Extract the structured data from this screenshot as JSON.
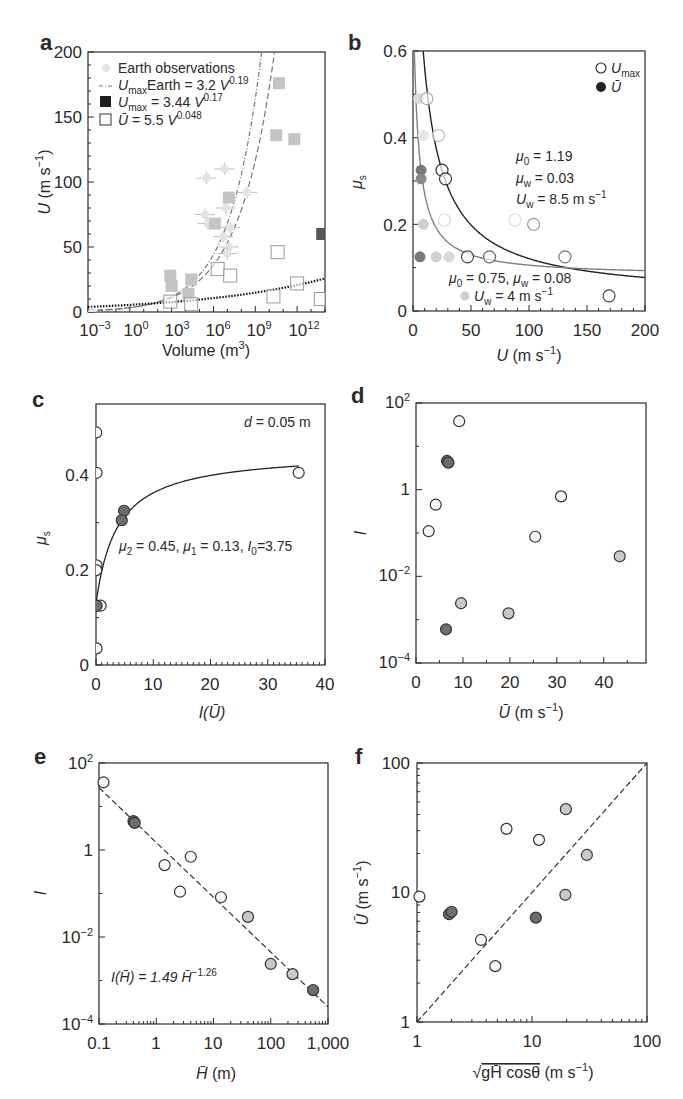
{
  "chart_data": [
    {
      "panel": "a",
      "type": "scatter",
      "xscale": "log",
      "xlabel": "Volume (m3)",
      "ylabel": "U (m s-1)",
      "xlim_log10": [
        -3,
        14
      ],
      "ylim": [
        0,
        200
      ],
      "xticks": [
        "10^-3",
        "10^0",
        "10^3",
        "10^6",
        "10^9",
        "10^12"
      ],
      "xtick_exp": [
        -3,
        0,
        3,
        6,
        9,
        12
      ],
      "yticks": [
        0,
        50,
        100,
        150,
        200
      ],
      "legend": [
        {
          "label": "Earth observations",
          "marker": "circle-light"
        },
        {
          "label": "UmaxEarth = 3.2 V^0.19",
          "marker": "dash-dot"
        },
        {
          "label": "Umax = 3.44 V^0.17",
          "marker": "square-filled"
        },
        {
          "label": "Ū = 5.5 V^0.048",
          "marker": "square-open"
        }
      ],
      "series": [
        {
          "name": "Earth observations",
          "points": [
            [
              -2.7,
              0
            ],
            [
              5.5,
              103
            ],
            [
              5.4,
              75
            ],
            [
              5.6,
              68
            ],
            [
              6.8,
              110
            ],
            [
              6.9,
              80
            ],
            [
              7.1,
              50
            ],
            [
              7.0,
              45
            ],
            [
              8.4,
              92
            ],
            [
              6.7,
              58
            ],
            [
              7.2,
              65
            ]
          ]
        },
        {
          "name": "Umax (filled squares)",
          "points": [
            [
              2.9,
              28
            ],
            [
              3.0,
              20
            ],
            [
              4.4,
              25
            ],
            [
              4.2,
              14
            ],
            [
              6.1,
              68
            ],
            [
              7.1,
              88
            ],
            [
              10.7,
              176
            ],
            [
              10.5,
              136
            ],
            [
              11.8,
              133
            ],
            [
              13.8,
              60
            ]
          ]
        },
        {
          "name": "Ū (open squares)",
          "points": [
            [
              2.9,
              8
            ],
            [
              4.4,
              6
            ],
            [
              6.3,
              33
            ],
            [
              7.2,
              28
            ],
            [
              10.6,
              46
            ],
            [
              10.3,
              12
            ],
            [
              12.0,
              22
            ],
            [
              13.7,
              10
            ]
          ]
        }
      ],
      "fits": [
        {
          "name": "UmaxEarth = 3.2 V^0.19",
          "a": 3.2,
          "b": 0.19,
          "style": "dash-dot"
        },
        {
          "name": "Umax = 3.44 V^0.17",
          "a": 3.44,
          "b": 0.17,
          "style": "dashed"
        },
        {
          "name": "Ū = 5.5 V^0.048",
          "a": 5.5,
          "b": 0.048,
          "style": "dotted"
        }
      ]
    },
    {
      "panel": "b",
      "type": "scatter",
      "xlabel": "U (m s-1)",
      "ylabel": "μs",
      "xlim": [
        0,
        200
      ],
      "ylim": [
        0,
        0.6
      ],
      "xticks": [
        0,
        50,
        100,
        150,
        200
      ],
      "yticks": [
        0,
        0.2,
        0.4,
        0.6
      ],
      "legend": [
        {
          "label": "Umax",
          "marker": "circle-open"
        },
        {
          "label": "Ū",
          "marker": "circle-filled"
        }
      ],
      "annotations": [
        {
          "text": "μ0 = 1.19",
          "x": 92,
          "y": 0.355
        },
        {
          "text": "μw = 0.03",
          "x": 92,
          "y": 0.305
        },
        {
          "text": "Uw = 8.5 m s-1",
          "x": 92,
          "y": 0.255
        },
        {
          "text": "μ0 = 0.75, μw = 0.08",
          "x": 30,
          "y": 0.075
        },
        {
          "text": "Uw = 4 m s-1",
          "x": 50,
          "y": 0.033
        }
      ],
      "series": [
        {
          "name": "Umax",
          "points": [
            [
              12,
              0.49
            ],
            [
              22,
              0.405
            ],
            [
              25,
              0.325
            ],
            [
              28,
              0.305
            ],
            [
              47,
              0.125
            ],
            [
              66,
              0.125
            ],
            [
              104,
              0.2
            ],
            [
              131,
              0.125
            ],
            [
              169,
              0.035
            ],
            [
              27,
              0.21
            ],
            [
              88,
              0.21
            ]
          ]
        },
        {
          "name": "Ū",
          "points": [
            [
              5,
              0.49
            ],
            [
              9,
              0.405
            ],
            [
              7,
              0.325
            ],
            [
              7,
              0.305
            ],
            [
              9,
              0.2
            ],
            [
              6,
              0.125
            ],
            [
              20,
              0.125
            ],
            [
              31,
              0.125
            ]
          ]
        }
      ],
      "fits": [
        {
          "name": "Umax fit",
          "mu0": 1.19,
          "muw": 0.03,
          "Uw": 8.5,
          "color": "#222222"
        },
        {
          "name": "Ū fit",
          "mu0": 0.75,
          "muw": 0.08,
          "Uw": 4,
          "color": "#808080"
        }
      ]
    },
    {
      "panel": "c",
      "type": "scatter",
      "xlabel": "I(Ū)",
      "ylabel": "μs",
      "xlim": [
        0,
        40
      ],
      "ylim": [
        0,
        0.55
      ],
      "xticks": [
        0,
        10,
        20,
        30,
        40
      ],
      "yticks": [
        0,
        0.2,
        0.4
      ],
      "annotations": [
        {
          "text": "d = 0.05 m"
        },
        {
          "text": "μ2 = 0.45, μ1 = 0.13, I0=3.75"
        }
      ],
      "fit": {
        "mu1": 0.13,
        "mu2": 0.45,
        "I0": 3.75
      },
      "series": [
        {
          "name": "open",
          "points": [
            [
              0.05,
              0.49
            ],
            [
              0.1,
              0.405
            ],
            [
              0.1,
              0.21
            ],
            [
              0.05,
              0.2
            ],
            [
              0.1,
              0.125
            ],
            [
              0.8,
              0.125
            ],
            [
              0.1,
              0.035
            ],
            [
              35.4,
              0.405
            ]
          ]
        },
        {
          "name": "dark",
          "points": [
            [
              4.9,
              0.325
            ],
            [
              4.5,
              0.305
            ],
            [
              0.1,
              0.125
            ]
          ]
        }
      ]
    },
    {
      "panel": "d",
      "type": "scatter",
      "xlabel": "Ū (m s-1)",
      "ylabel": "I",
      "yscale": "log",
      "xlim": [
        0,
        49
      ],
      "ylim_log10": [
        -4,
        2
      ],
      "xticks": [
        0,
        10,
        20,
        30,
        40
      ],
      "yticks": [
        "10^-4",
        "10^-2",
        "1",
        "10^2"
      ],
      "series": [
        {
          "name": "open",
          "points": [
            [
              9.2,
              38
            ],
            [
              4.2,
              0.45
            ],
            [
              2.7,
              0.11
            ],
            [
              25.4,
              0.082
            ],
            [
              30.9,
              0.7
            ]
          ]
        },
        {
          "name": "light-grey",
          "points": [
            [
              9.6,
              0.0024
            ],
            [
              19.7,
              0.0014
            ],
            [
              43.4,
              0.029
            ]
          ]
        },
        {
          "name": "dark",
          "points": [
            [
              6.6,
              4.6
            ],
            [
              6.9,
              4.2
            ],
            [
              6.4,
              0.0006
            ]
          ]
        }
      ]
    },
    {
      "panel": "e",
      "type": "scatter",
      "xlabel": "H̄ (m)",
      "ylabel": "I",
      "xscale": "log",
      "yscale": "log",
      "xlim_log10": [
        -1,
        3
      ],
      "ylim_log10": [
        -4,
        2
      ],
      "xticks": [
        "0.1",
        "1",
        "10",
        "100",
        "1,000"
      ],
      "yticks": [
        "10^-4",
        "10^-2",
        "1",
        "10^2"
      ],
      "annotation": "I(H̄) = 1.49 H̄^-1.26",
      "fit": {
        "a": 1.49,
        "b": -1.26,
        "style": "dashed"
      },
      "series": [
        {
          "name": "open",
          "points": [
            [
              0.12,
              36
            ],
            [
              1.4,
              0.45
            ],
            [
              2.6,
              0.11
            ],
            [
              13.5,
              0.082
            ],
            [
              4.0,
              0.7
            ]
          ]
        },
        {
          "name": "light-grey",
          "points": [
            [
              40,
              0.029
            ],
            [
              100,
              0.0024
            ],
            [
              240,
              0.0014
            ]
          ]
        },
        {
          "name": "dark",
          "points": [
            [
              0.4,
              4.6
            ],
            [
              0.42,
              4.2
            ],
            [
              550,
              0.0006
            ]
          ]
        }
      ]
    },
    {
      "panel": "f",
      "type": "scatter",
      "xlabel": "√(g H̄ cosθ) (m s-1)",
      "ylabel": "Ū (m s-1)",
      "xscale": "log",
      "yscale": "log",
      "xlim": [
        1,
        100
      ],
      "ylim": [
        1,
        100
      ],
      "xticks": [
        "1",
        "10",
        "100"
      ],
      "yticks": [
        "1",
        "10",
        "100"
      ],
      "reference_line": "1:1 dashed",
      "series": [
        {
          "name": "open",
          "points": [
            [
              1.05,
              9.3
            ],
            [
              3.6,
              4.3
            ],
            [
              4.8,
              2.7
            ],
            [
              6.0,
              31
            ],
            [
              11.5,
              25.5
            ]
          ]
        },
        {
          "name": "light-grey",
          "points": [
            [
              19.7,
              44
            ],
            [
              30,
              19.5
            ],
            [
              19.5,
              9.6
            ]
          ]
        },
        {
          "name": "dark",
          "points": [
            [
              1.9,
              6.8
            ],
            [
              2.0,
              7.1
            ],
            [
              10.8,
              6.4
            ]
          ]
        }
      ]
    }
  ],
  "labels": {
    "a": {
      "panel": "a",
      "legend_earth": "Earth observations",
      "legend_fit1_sym": "U",
      "legend_fit1_sub": "max",
      "legend_fit1_rest": "Earth = 3.2 ",
      "legend_fit1_v": "V",
      "legend_fit1_exp": "0.19",
      "legend_fit2_sym": "U",
      "legend_fit2_sub": "max",
      "legend_fit2_rest": " = 3.44 ",
      "legend_fit2_v": "V",
      "legend_fit2_exp": "0.17",
      "legend_fit3_sym": "Ū",
      "legend_fit3_rest": " = 5.5 ",
      "legend_fit3_v": "V",
      "legend_fit3_exp": "0.048",
      "xlabel": "Volume (m",
      "xlabel_sup": "3",
      "xlabel_end": ")",
      "ylabel_u": "U",
      "ylabel_rest": " (m s",
      "ylabel_sup": "−1",
      "ylabel_end": ")",
      "yticks": [
        "0",
        "50",
        "100",
        "150",
        "200"
      ],
      "xticks_base": "10",
      "xticks_exp": [
        "−3",
        "0",
        "3",
        "6",
        "9",
        "12"
      ]
    },
    "b": {
      "panel": "b",
      "yticks": [
        "0",
        "0.2",
        "0.4",
        "0.6"
      ],
      "xticks": [
        "0",
        "50",
        "100",
        "150",
        "200"
      ],
      "ylabel": "μ",
      "ylabel_sub": "s",
      "xlabel_u": "U",
      "xlabel_rest": " (m s",
      "xlabel_sup": "−1",
      "xlabel_end": ")",
      "legend_umax": "U",
      "legend_umax_sub": "max",
      "legend_ubar": "Ū",
      "ann1_mu": "μ",
      "ann1_sub": "0",
      "ann1_rest": " = 1.19",
      "ann2_mu": "μ",
      "ann2_sub": "w",
      "ann2_rest": " = 0.03",
      "ann3_u": "U",
      "ann3_sub": "w",
      "ann3_rest": " = 8.5 m s",
      "ann3_sup": "−1",
      "ann4_mu": "μ",
      "ann4_sub": "0",
      "ann4_mid": " = 0.75, ",
      "ann4_mu2": "μ",
      "ann4_sub2": "w",
      "ann4_rest": " = 0.08",
      "ann5_u": "U",
      "ann5_sub": "w",
      "ann5_rest": " = 4 m s",
      "ann5_sup": "−1"
    },
    "c": {
      "panel": "c",
      "yticks": [
        "0",
        "0.2",
        "0.4"
      ],
      "xticks": [
        "0",
        "10",
        "20",
        "30",
        "40"
      ],
      "ylabel": "μ",
      "ylabel_sub": "s",
      "xlabel": "I(Ū)",
      "ann_d": "d",
      "ann_d_rest": " = 0.05 m",
      "ann_mu2": "μ",
      "ann_mu2_sub": "2",
      "ann_mu2_rest": " = 0.45, ",
      "ann_mu1": "μ",
      "ann_mu1_sub": "1",
      "ann_mu1_rest": " = 0.13, ",
      "ann_i0": "I",
      "ann_i0_sub": "0",
      "ann_i0_rest": "=3.75"
    },
    "d": {
      "panel": "d",
      "xticks": [
        "0",
        "10",
        "20",
        "30",
        "40"
      ],
      "ytick_1": "1",
      "ytick_base": "10",
      "ytick_exp": [
        "−4",
        "−2",
        "2"
      ],
      "ylabel": "I",
      "xlabel_u": "Ū",
      "xlabel_rest": " (m s",
      "xlabel_sup": "−1",
      "xlabel_end": ")"
    },
    "e": {
      "panel": "e",
      "xticks": [
        "0.1",
        "1",
        "10",
        "100",
        "1,000"
      ],
      "ytick_1": "1",
      "ytick_base": "10",
      "ytick_exp": [
        "−4",
        "−2",
        "2"
      ],
      "ylabel": "I",
      "xlabel_h": "H̄",
      "xlabel_rest": " (m)",
      "ann_lhs": "I(H̄) = 1.49 ",
      "ann_h": "H̄",
      "ann_exp": "−1.26"
    },
    "f": {
      "panel": "f",
      "xticks": [
        "1",
        "10",
        "100"
      ],
      "yticks": [
        "1",
        "10",
        "100"
      ],
      "ylabel_u": "Ū",
      "ylabel_rest": " (m s",
      "ylabel_sup": "−1",
      "ylabel_end": ")",
      "xlabel_root": "√",
      "xlabel_inner": "gH̄ cosθ",
      "xlabel_rest": " (m s",
      "xlabel_sup": "−1",
      "xlabel_end": ")"
    }
  },
  "colors": {
    "frame": "#2a2a2a",
    "open_fill": "#f7f7f7",
    "light_grey_fill": "#c9c9c9",
    "dark_fill": "#6e6e6e",
    "earth_fill": "#e2e2e2",
    "square_fill": "#c4c4c4",
    "fit_grey": "#8a8a8a"
  }
}
